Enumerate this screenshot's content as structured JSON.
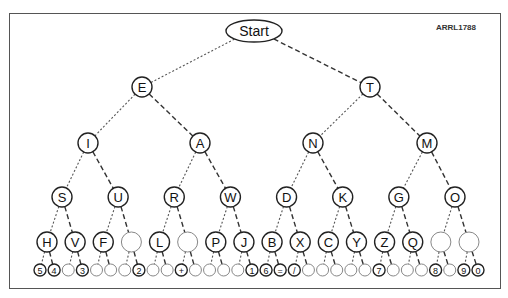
{
  "figure_code": "ARRL1788",
  "root": "Start",
  "legend": {
    "dot_branch": "left (dit)",
    "dash_branch": "right (dah)"
  },
  "levels": [
    [
      "E",
      "T"
    ],
    [
      "I",
      "A",
      "N",
      "M"
    ],
    [
      "S",
      "U",
      "R",
      "W",
      "D",
      "K",
      "G",
      "O"
    ],
    [
      "H",
      "V",
      "F",
      "",
      "L",
      "",
      "P",
      "J",
      "B",
      "X",
      "C",
      "Y",
      "Z",
      "Q",
      "",
      ""
    ],
    [
      "5",
      "4",
      "",
      "3",
      "",
      "",
      "",
      "2",
      "",
      "",
      "+",
      "",
      "",
      "",
      "",
      "1",
      "6",
      "=",
      "/",
      "",
      "",
      "",
      "",
      "",
      "7",
      "",
      "",
      "",
      "8",
      "",
      "9",
      "0"
    ]
  ]
}
